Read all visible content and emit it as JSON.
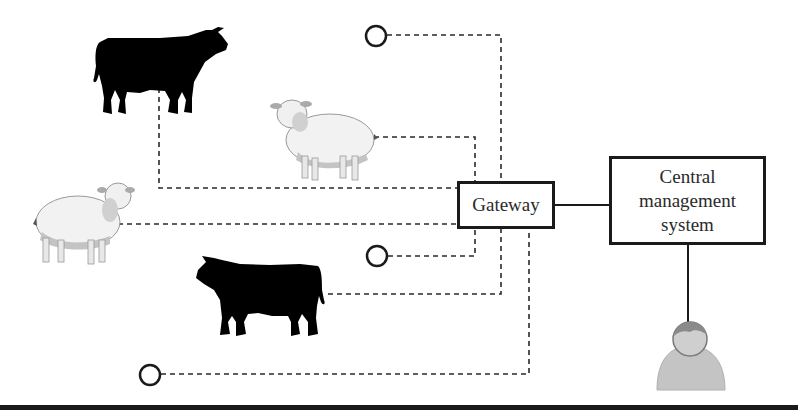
{
  "diagram": {
    "nodes": {
      "gateway": {
        "label": "Gateway"
      },
      "central_management_system": {
        "label_lines": [
          "Central",
          "management",
          "system"
        ]
      }
    },
    "entities": [
      {
        "id": "cow-1",
        "type": "cow",
        "facing": "right"
      },
      {
        "id": "sheep-1",
        "type": "sheep",
        "facing": "left"
      },
      {
        "id": "sheep-2",
        "type": "sheep",
        "facing": "right"
      },
      {
        "id": "cow-2",
        "type": "cow",
        "facing": "left"
      },
      {
        "id": "sensor-1",
        "type": "sensor-node"
      },
      {
        "id": "sensor-2",
        "type": "sensor-node"
      },
      {
        "id": "sensor-3",
        "type": "sensor-node"
      },
      {
        "id": "user",
        "type": "user"
      }
    ],
    "connections": [
      {
        "from": "sensor-1",
        "to": "gateway",
        "style": "dashed"
      },
      {
        "from": "cow-1",
        "to": "gateway",
        "style": "dashed"
      },
      {
        "from": "sheep-1",
        "to": "gateway",
        "style": "dashed"
      },
      {
        "from": "sheep-2",
        "to": "gateway",
        "style": "dashed"
      },
      {
        "from": "sensor-2",
        "to": "gateway",
        "style": "dashed"
      },
      {
        "from": "cow-2",
        "to": "gateway",
        "style": "dashed"
      },
      {
        "from": "sensor-3",
        "to": "gateway",
        "style": "dashed"
      },
      {
        "from": "gateway",
        "to": "central_management_system",
        "style": "solid"
      },
      {
        "from": "central_management_system",
        "to": "user",
        "style": "solid"
      }
    ],
    "colors": {
      "line": "#2a2a2a",
      "cow": "#000000",
      "sheep_wool": "#f2f2f2",
      "sheep_shade": "#bdbdbd",
      "user_body": "#c4c4c4",
      "user_hair": "#8a8a8a"
    }
  }
}
